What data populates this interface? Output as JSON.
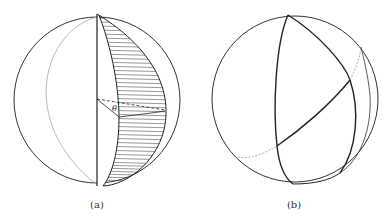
{
  "figure": {
    "panels": [
      {
        "id": "a",
        "caption": "(a)",
        "angle_label": "θ",
        "description": "Sphere with shaded lune bounded by two great semicircles through the poles; dihedral angle theta marked at center"
      },
      {
        "id": "b",
        "caption": "(b)",
        "description": "Sphere with spherical triangle formed by three great circle arcs; hidden portions dashed"
      }
    ]
  },
  "colors": {
    "stroke": "#222222",
    "faint": "#999999",
    "hatch": "#333333",
    "background": "#ffffff"
  }
}
